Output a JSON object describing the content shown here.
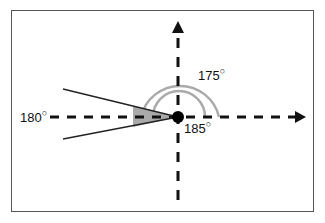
{
  "diagram": {
    "type": "angle-diagram",
    "labels": {
      "left_axis": "180",
      "outer_arc": "175",
      "inner_arc": "185",
      "degree_symbol": "○"
    },
    "colors": {
      "axis": "#111111",
      "arc": "#aaaaaa",
      "wedge": "#9a9a9a",
      "frame": "#555555"
    }
  }
}
